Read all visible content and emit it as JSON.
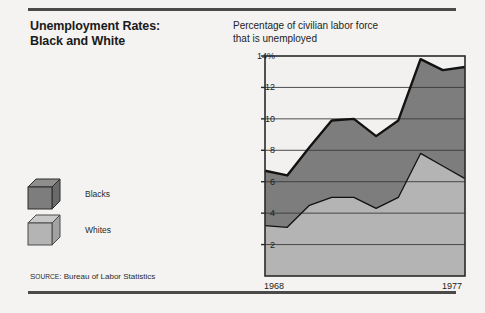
{
  "title": {
    "line1": "Unemployment Rates:",
    "line2": "Black and White"
  },
  "chart_header": {
    "line1": "Percentage of civilian labor force",
    "line2": "that is unemployed"
  },
  "legend": {
    "items": [
      {
        "label": "Blacks",
        "color": "#7d7d7d",
        "icon": "cube-icon"
      },
      {
        "label": "Whites",
        "color": "#b4b4b4",
        "icon": "cube-icon"
      }
    ]
  },
  "source": {
    "prefix": "S",
    "prefix_rest": "OURCE",
    "colon": ":",
    "text": "Bureau of Labor Statistics",
    "full": "SOURCE: Bureau of Labor Statistics"
  },
  "colors": {
    "blacks_fill": "#7d7d7d",
    "whites_fill": "#b4b4b4",
    "line": "#121212",
    "grid": "#3a3a3a",
    "axis": "#2a2a2a",
    "page_bg": "#f4f3f1",
    "plot_bg": "#f2f1ef"
  },
  "chart_data": {
    "type": "area",
    "title": "Unemployment Rates: Black and White",
    "subtitle": "Percentage of civilian labor force that is unemployed",
    "xlabel": "",
    "ylabel": "",
    "x": [
      1968,
      1969,
      1970,
      1971,
      1972,
      1973,
      1974,
      1975,
      1976,
      1977
    ],
    "categories": [
      "1968",
      "1969",
      "1970",
      "1971",
      "1972",
      "1973",
      "1974",
      "1975",
      "1976",
      "1977"
    ],
    "xtick_labels": [
      "1968",
      "1977"
    ],
    "xtick_values": [
      1968,
      1977
    ],
    "ytick_labels": [
      "2",
      "4",
      "6",
      "8",
      "10",
      "12",
      "14%"
    ],
    "ytick_values": [
      2,
      4,
      6,
      8,
      10,
      12,
      14
    ],
    "ylim": [
      0,
      14
    ],
    "xlim": [
      1968,
      1977
    ],
    "grid": true,
    "grid_axis": "y",
    "legend_position": "left-panel",
    "stacked": false,
    "series": [
      {
        "name": "Blacks",
        "color": "#7d7d7d",
        "values": [
          6.7,
          6.4,
          8.2,
          9.9,
          10.0,
          8.9,
          9.9,
          13.8,
          13.1,
          13.3
        ]
      },
      {
        "name": "Whites",
        "color": "#b4b4b4",
        "values": [
          3.2,
          3.1,
          4.5,
          5.0,
          5.0,
          4.3,
          5.0,
          7.8,
          7.0,
          6.2
        ]
      }
    ],
    "source": "Bureau of Labor Statistics"
  }
}
